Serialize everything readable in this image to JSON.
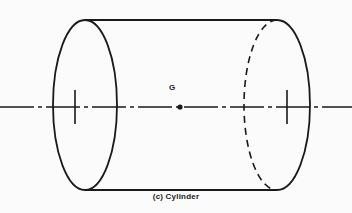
{
  "figure": {
    "caption": "(c) Cylinder",
    "centroid_label": "G",
    "shape_name": "cylinder",
    "background_color": "#fbfbfb",
    "line_color": "#1a1a1a"
  },
  "geometry": {
    "canvas": {
      "width": 352,
      "height": 213
    },
    "near_ellipse": {
      "cx": 85,
      "cy": 105,
      "rx": 32,
      "ry": 85,
      "style": "solid"
    },
    "far_ellipse": {
      "cx": 277,
      "cy": 105,
      "rx": 33,
      "ry": 85,
      "visible_half": "right-solid",
      "hidden_half": "left-dashed"
    },
    "top_line": {
      "x1": 85,
      "y1": 20,
      "x2": 277,
      "y2": 20
    },
    "bottom_line": {
      "x1": 85,
      "y1": 190,
      "x2": 277,
      "y2": 190
    },
    "axis_line": {
      "x1": 0,
      "y1": 107,
      "x2": 352,
      "y2": 107,
      "style": "dash-dot"
    },
    "centroid_point": {
      "cx": 180,
      "cy": 107,
      "r": 2.6
    },
    "tick_marks": [
      {
        "x": 75,
        "y1": 90,
        "y2": 124
      },
      {
        "x": 287,
        "y1": 90,
        "y2": 124
      }
    ]
  }
}
